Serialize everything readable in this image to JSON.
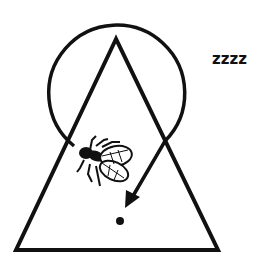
{
  "diagram": {
    "sleep_text": "zzzz",
    "elements": [
      "triangle",
      "looping-arrow",
      "fly",
      "dot",
      "sleep-text"
    ],
    "stroke_color": "#111111",
    "background": "#ffffff"
  }
}
